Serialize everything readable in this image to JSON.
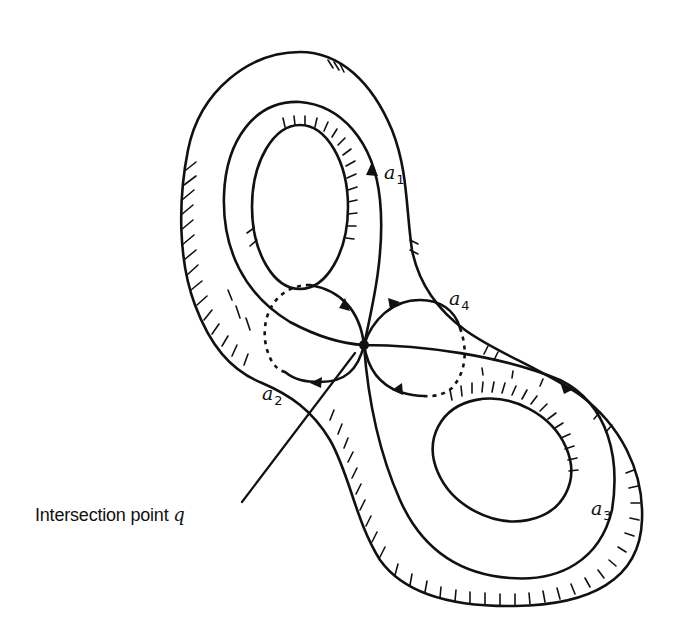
{
  "figure": {
    "colors": {
      "ink": "#111111",
      "background": "#ffffff"
    },
    "labels": {
      "a1": {
        "base": "a",
        "sub": "1"
      },
      "a2": {
        "base": "a",
        "sub": "2"
      },
      "a3": {
        "base": "a",
        "sub": "3"
      },
      "a4": {
        "base": "a",
        "sub": "4"
      }
    },
    "callout": {
      "text": "Intersection point ",
      "symbol": "q"
    }
  }
}
